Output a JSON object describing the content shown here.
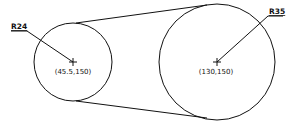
{
  "diagram": {
    "type": "cad-drawing",
    "left_circle": {
      "radius_label": "R24",
      "center_label": "(45.5,150)"
    },
    "right_circle": {
      "radius_label": "R35",
      "center_label": "(130,150)"
    },
    "tangent_lines": 2
  }
}
